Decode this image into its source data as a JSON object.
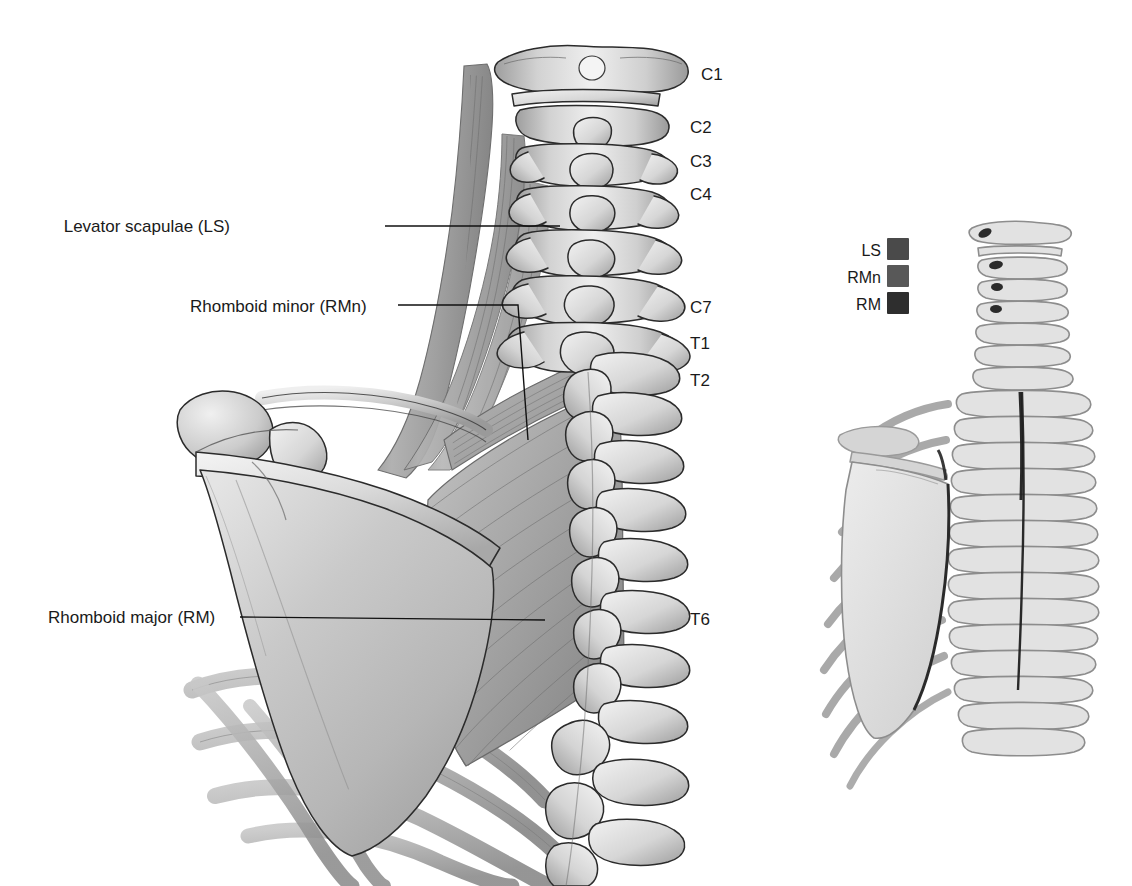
{
  "figure": {
    "background_color": "#ffffff"
  },
  "callouts": [
    {
      "id": "levator-scapulae",
      "label": "Levator scapulae (LS)",
      "abbr": "LS",
      "text_x": 230,
      "text_y": 232,
      "leader": "M 385 226 L 560 226"
    },
    {
      "id": "rhomboid-minor",
      "label": "Rhomboid minor (RMn)",
      "abbr": "RMn",
      "text_x": 190,
      "text_y": 312,
      "leader": "M 398 305 L 518 305 L 528 440"
    },
    {
      "id": "rhomboid-major",
      "label": "Rhomboid major (RM)",
      "abbr": "RM",
      "text_x": 48,
      "text_y": 623,
      "leader": "M 240 617 L 545 620"
    }
  ],
  "vertebra_labels": [
    {
      "id": "C1",
      "text": "C1",
      "x": 701,
      "y": 80
    },
    {
      "id": "C2",
      "text": "C2",
      "x": 690,
      "y": 133
    },
    {
      "id": "C3",
      "text": "C3",
      "x": 690,
      "y": 167
    },
    {
      "id": "C4",
      "text": "C4",
      "x": 690,
      "y": 200
    },
    {
      "id": "C7",
      "text": "C7",
      "x": 690,
      "y": 313
    },
    {
      "id": "T1",
      "text": "T1",
      "x": 690,
      "y": 349
    },
    {
      "id": "T2",
      "text": "T2",
      "x": 690,
      "y": 386
    },
    {
      "id": "T6",
      "text": "T6",
      "x": 690,
      "y": 625
    }
  ],
  "legend": {
    "title": "",
    "x": 848,
    "y": 234,
    "swatch_size": 22,
    "row_height": 27,
    "items": [
      {
        "label": "LS",
        "color": "#4a4a4a",
        "name": "levator-scapulae"
      },
      {
        "label": "RMn",
        "color": "#585858",
        "name": "rhomboid-minor"
      },
      {
        "label": "RM",
        "color": "#2e2e2e",
        "name": "rhomboid-major"
      }
    ]
  },
  "colors": {
    "bone_light": "#ededed",
    "bone_mid": "#d0d0d0",
    "bone_shadow": "#a7a7a7",
    "bone_outline": "#2b2b2b",
    "muscle_light": "#c3c3c3",
    "muscle_mid": "#a5a5a5",
    "muscle_dark": "#8a8a8a",
    "scapula_fill": "#cfcfcf",
    "rib_fill": "#b5b5b5",
    "inset_fill": "#e2e2e2",
    "inset_stroke": "#8f8f8f",
    "text": "#1a1a1a"
  },
  "inset": {
    "name": "skeletal-reference-inset",
    "origin_x": 855,
    "origin_y": 225,
    "attachment_marks": [
      {
        "for": "LS",
        "color": "#2b2b2b"
      },
      {
        "for": "RMn",
        "color": "#3a3a3a"
      },
      {
        "for": "RM",
        "color": "#222222"
      }
    ]
  }
}
